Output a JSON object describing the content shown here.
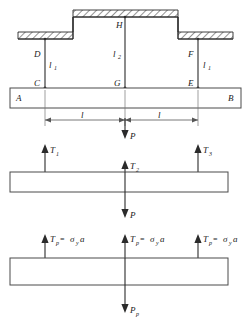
{
  "figure": {
    "width": 251,
    "height": 330,
    "background_color": "#ffffff",
    "line_color": "#2b2b2b",
    "dim_color": "#555555"
  },
  "diagram_top": {
    "name": "structure-with-supports",
    "ceiling_label": "hatched-fixed-support",
    "points": {
      "A": "A",
      "B": "B",
      "C": "C",
      "D": "D",
      "E": "E",
      "F": "F",
      "G": "G",
      "H": "H"
    },
    "rod_lengths": {
      "left": "l",
      "left_sub": "1",
      "middle": "l",
      "middle_sub": "2",
      "right": "l",
      "right_sub": "1"
    },
    "spans": {
      "left": "l",
      "right": "l"
    },
    "applied_load": "P"
  },
  "diagram_middle": {
    "name": "elastic-free-body",
    "forces": [
      {
        "symbol": "T",
        "sub": "1",
        "direction": "up"
      },
      {
        "symbol": "T",
        "sub": "2",
        "direction": "up"
      },
      {
        "symbol": "T",
        "sub": "3",
        "direction": "up"
      }
    ],
    "applied_load": "P",
    "applied_load_bottom": "P"
  },
  "diagram_bottom": {
    "name": "plastic-free-body",
    "forces": [
      {
        "symbol": "T",
        "sub": "p",
        "equals": "=",
        "stress": "σ",
        "stress_sub": "y",
        "area": "a"
      },
      {
        "symbol": "T",
        "sub": "p",
        "equals": "=",
        "stress": "σ",
        "stress_sub": "y",
        "area": "a"
      },
      {
        "symbol": "T",
        "sub": "p",
        "equals": "=",
        "stress": "σ",
        "stress_sub": "y",
        "area": "a"
      }
    ],
    "applied_load_top": "P",
    "applied_load_bottom": {
      "symbol": "P",
      "sub": "p"
    }
  }
}
